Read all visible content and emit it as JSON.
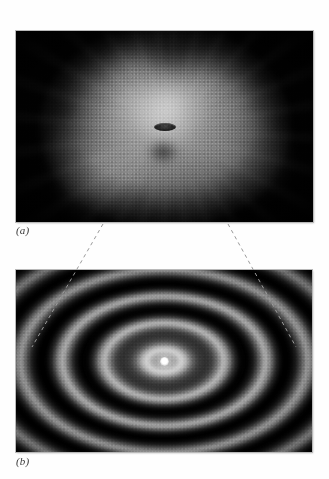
{
  "figure": {
    "background_color": "#fefefe",
    "panels": [
      {
        "id": "a",
        "caption": "(a)",
        "name": "diffuse-halo-panel",
        "description": "wide-field speckle halo with small dark elliptical core",
        "frame_color": "#b9b9b9",
        "field_color": "#000000",
        "halo_color": "#b2b2b2"
      },
      {
        "id": "b",
        "caption": "(b)",
        "name": "interference-rings-panel",
        "description": "magnified concentric elliptical diffraction fringes with bright central spot",
        "frame_color": "#b9b9b9",
        "field_color": "#000000",
        "fringe_bright_color": "#bdbdbd",
        "center_spot_color": "#ffffff"
      }
    ],
    "leaders": {
      "name": "magnification-leader-lines",
      "color": "#9a9a9a",
      "style": "dashed",
      "lines": [
        {
          "x1": 103,
          "y1": 224,
          "x2": 32,
          "y2": 347
        },
        {
          "x1": 228,
          "y1": 224,
          "x2": 296,
          "y2": 347
        }
      ]
    },
    "chart_data": {
      "type": "heatmap",
      "title": "",
      "xlabel": "",
      "ylabel": "",
      "panels": [
        {
          "id": "a",
          "label": "(a)",
          "kind": "intensity-map",
          "feature": "diffuse turbulent halo",
          "center": [
            148,
            96
          ],
          "extent_px": [
            250,
            205
          ],
          "peak_intensity": 0.72,
          "background_intensity": 0.0,
          "core_object": {
            "shape": "ellipse",
            "width_px": 22,
            "height_px": 8,
            "intensity": 0.18
          }
        },
        {
          "id": "b",
          "label": "(b)",
          "kind": "radial-fringe-map",
          "feature": "concentric elliptical interference rings",
          "center": [
            148,
            91
          ],
          "ellipse_aspect_ratio": 1.58,
          "ring_period_px": 42,
          "ring_count": 5,
          "ring_peak_radii_px": [
            17,
            38,
            59,
            80,
            101
          ],
          "ring_peak_intensities": [
            0.74,
            0.62,
            0.48,
            0.33,
            0.18
          ],
          "center_spot_intensity": 1.0,
          "background_intensity": 0.0
        }
      ]
    }
  }
}
